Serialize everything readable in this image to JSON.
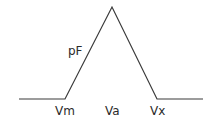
{
  "diagram": {
    "type": "triangular-membership-function",
    "stroke_color": "#3a3a3a",
    "curve_label": "pF",
    "points": {
      "left_start": [
        19,
        99
      ],
      "vm": [
        65,
        99
      ],
      "apex": [
        112,
        7
      ],
      "vx": [
        157,
        99
      ],
      "right_end": [
        203,
        99
      ]
    },
    "labels": {
      "vm": "Vm",
      "va": "Va",
      "vx": "Vx"
    }
  }
}
